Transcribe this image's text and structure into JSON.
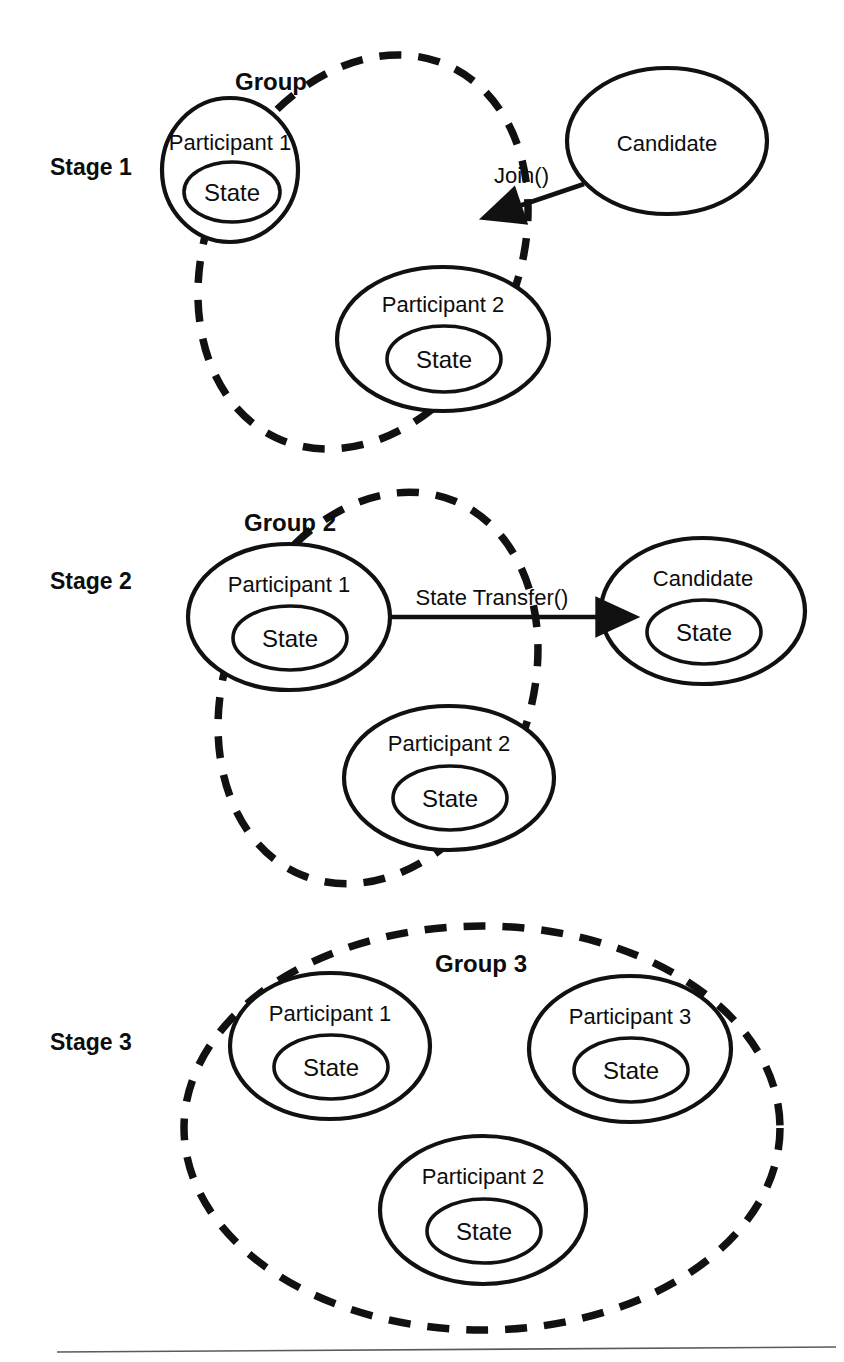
{
  "figure": {
    "background_color": "#ffffff",
    "line_color": "#111111",
    "text_color": "#0d0d0d",
    "footer_rule_color": "#5a5a5a"
  },
  "labels": {
    "state": "State"
  },
  "stages": [
    {
      "id": "stage-1",
      "stage_label": "Stage 1",
      "group_label": "Group",
      "participants": [
        {
          "name": "Participant 1",
          "state": "State"
        },
        {
          "name": "Participant 2",
          "state": "State"
        }
      ],
      "external": [
        {
          "name": "Candidate",
          "has_state": false
        }
      ],
      "edge": {
        "label": "Join()",
        "from": "Candidate",
        "to": "Group",
        "direction": "right-to-left"
      }
    },
    {
      "id": "stage-2",
      "stage_label": "Stage 2",
      "group_label": "Group 2",
      "participants": [
        {
          "name": "Participant 1",
          "state": "State"
        },
        {
          "name": "Participant 2",
          "state": "State"
        }
      ],
      "external": [
        {
          "name": "Candidate",
          "has_state": true,
          "state": "State"
        }
      ],
      "edge": {
        "label": "State Transfer()",
        "from": "Participant 1",
        "to": "Candidate",
        "direction": "left-to-right"
      }
    },
    {
      "id": "stage-3",
      "stage_label": "Stage 3",
      "group_label": "Group 3",
      "participants": [
        {
          "name": "Participant 1",
          "state": "State"
        },
        {
          "name": "Participant 3",
          "state": "State"
        },
        {
          "name": "Participant 2",
          "state": "State"
        }
      ],
      "external": [],
      "edge": null
    }
  ]
}
